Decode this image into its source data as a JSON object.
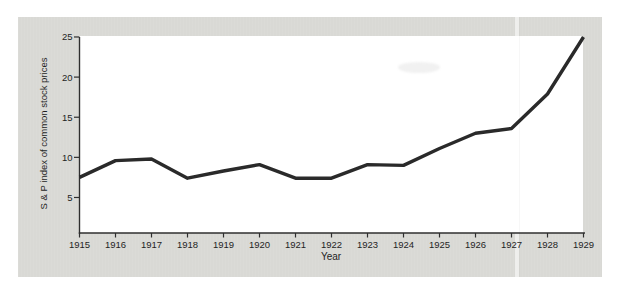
{
  "chart_data": {
    "type": "line",
    "title": "",
    "xlabel": "Year",
    "ylabel": "S & P index of common stock prices",
    "x": [
      1915,
      1916,
      1917,
      1918,
      1919,
      1920,
      1921,
      1922,
      1923,
      1924,
      1925,
      1926,
      1927,
      1928,
      1929
    ],
    "values": [
      7.5,
      9.6,
      9.8,
      7.4,
      8.3,
      9.1,
      7.4,
      7.4,
      9.1,
      9.0,
      11.1,
      13.0,
      13.6,
      17.9,
      25.0
    ],
    "y_ticks": [
      5,
      10,
      15,
      20,
      25
    ],
    "ylim": [
      0,
      25
    ],
    "xlim": [
      1915,
      1929
    ],
    "grid": false,
    "legend": "none",
    "line_color": "#2a2a2a",
    "axis_color": "#2f2f2f",
    "panel_background": "#d9d9d5",
    "plot_background": "#ffffff"
  }
}
